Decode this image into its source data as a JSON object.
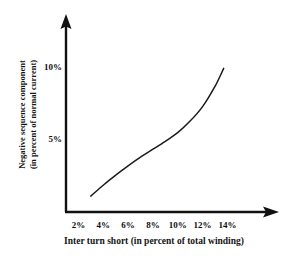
{
  "chart_data": {
    "type": "line",
    "title": "",
    "xlabel": "Inter turn short (in percent of total winding)",
    "ylabel_line1": "Negative sequence component",
    "ylabel_line2": "(in percent of normal current)",
    "xticks": [
      "2%",
      "4%",
      "6%",
      "8%",
      "10%",
      "12%",
      "14%"
    ],
    "xtick_values": [
      2,
      4,
      6,
      8,
      10,
      12,
      14
    ],
    "yticks": [
      "5%",
      "10%"
    ],
    "ytick_values": [
      5,
      10
    ],
    "xlim": [
      1,
      15.5
    ],
    "ylim": [
      0,
      11.5
    ],
    "grid": false,
    "legend": null,
    "series": [
      {
        "name": "Negative sequence component",
        "x": [
          3.0,
          4.0,
          5.0,
          6.0,
          7.0,
          8.0,
          9.0,
          10.0,
          11.0,
          12.0,
          13.0,
          13.7
        ],
        "y": [
          1.1,
          1.85,
          2.55,
          3.2,
          3.8,
          4.35,
          4.9,
          5.5,
          6.3,
          7.3,
          8.7,
          9.95
        ],
        "color": "#1a1a1a",
        "linewidth": 1.5
      }
    ],
    "axis_color": "#111111",
    "axes_style": "arrow-tipped L-frame"
  }
}
